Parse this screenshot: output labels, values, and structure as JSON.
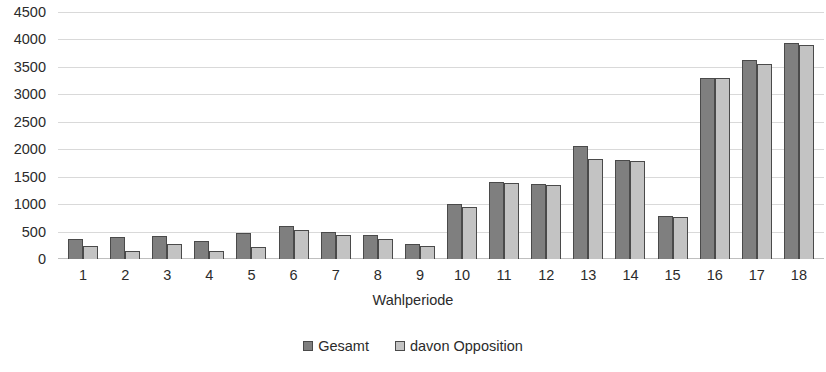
{
  "chart_data": {
    "type": "bar",
    "title": "",
    "subtitle": "",
    "xlabel": "Wahlperiode",
    "ylabel": "",
    "categories": [
      "1",
      "2",
      "3",
      "4",
      "5",
      "6",
      "7",
      "8",
      "9",
      "10",
      "11",
      "12",
      "13",
      "14",
      "15",
      "16",
      "17",
      "18"
    ],
    "series": [
      {
        "name": "Gesamt",
        "color": "#7f7f7f",
        "values": [
          360,
          410,
          420,
          320,
          480,
          600,
          500,
          440,
          280,
          1000,
          1410,
          1360,
          2060,
          1800,
          780,
          3300,
          3620,
          3930
        ]
      },
      {
        "name": "davon Opposition",
        "color": "#c3c3c3",
        "values": [
          230,
          150,
          280,
          140,
          220,
          520,
          430,
          360,
          240,
          940,
          1390,
          1340,
          1830,
          1790,
          770,
          3290,
          3560,
          3890
        ]
      }
    ],
    "ylim": [
      0,
      4500
    ],
    "ytick_step": 500,
    "yticks": [
      "4500",
      "4000",
      "3500",
      "3000",
      "2500",
      "2000",
      "1500",
      "1000",
      "500",
      "0"
    ],
    "grid": true,
    "legend_position": "bottom"
  },
  "axis": {
    "x_title": "Wahlperiode"
  },
  "legend": {
    "items": [
      {
        "label": "Gesamt"
      },
      {
        "label": "davon Opposition"
      }
    ]
  }
}
